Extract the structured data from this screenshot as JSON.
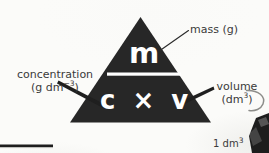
{
  "figure": {
    "kind": "formula-triangle",
    "background_color": "#fbfbf9",
    "triangle_fill": "#272727",
    "text_on_triangle_color": "#ffffff",
    "label_text_color": "#3a3a3a"
  },
  "triangle": {
    "numerator": "m",
    "denominator": "c × v",
    "fraction_bar": true
  },
  "labels": {
    "mass": {
      "text": "mass (g)",
      "points_to": "m"
    },
    "concentration": {
      "line1": "concentration",
      "line2_prefix": "(g dm",
      "line2_exponent": "−3",
      "line2_suffix": ")",
      "points_to": "c"
    },
    "volume": {
      "line1": "volume",
      "line2_prefix": "(dm",
      "line2_exponent": "3",
      "line2_suffix": ")",
      "points_to": "v"
    },
    "cube_volume": {
      "prefix": "1 dm",
      "exponent": "3"
    }
  },
  "annotations": {
    "leader_lines": [
      "mass-leader",
      "concentration-leader",
      "volume-leader"
    ],
    "curved_arrow": "curved-arrow-to-cube",
    "rule": "horizontal-rule-bottom-left",
    "cropped_shape": "cube-illustration-partial"
  }
}
